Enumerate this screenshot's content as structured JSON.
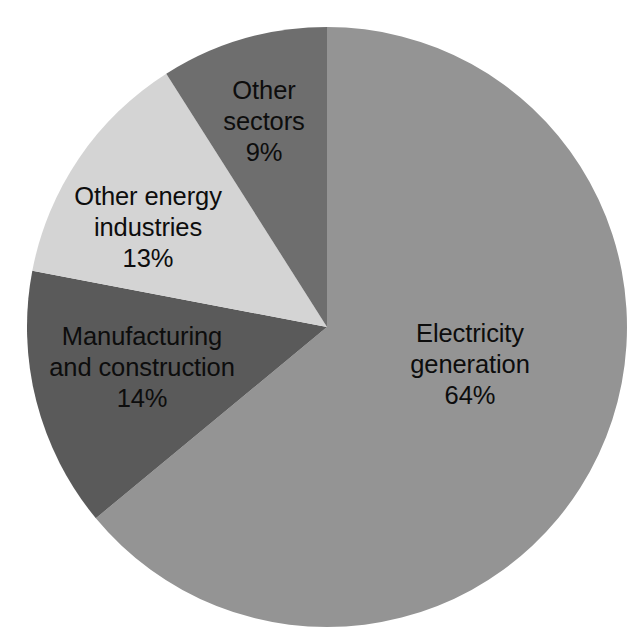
{
  "chart_data": {
    "type": "pie",
    "title": "",
    "subtitle": "",
    "xlabel": "",
    "ylabel": "",
    "legend_position": "none",
    "grid": false,
    "labels_inside": true,
    "units": "percent",
    "total": 100,
    "categories": [
      "Electricity generation",
      "Manufacturing and construction",
      "Other energy industries",
      "Other sectors"
    ],
    "values": [
      64,
      14,
      13,
      9
    ],
    "value_labels": [
      "64%",
      "14%",
      "13%",
      "9%"
    ],
    "colors": [
      "#949494",
      "#5a5a5a",
      "#d4d4d4",
      "#6e6e6e"
    ],
    "start_angle_deg": 0,
    "direction": "clockwise",
    "slices": [
      {
        "name": "Electricity generation",
        "label_lines": [
          "Electricity",
          "generation"
        ],
        "value": 64,
        "value_label": "64%",
        "color": "#949494",
        "start_deg": 0,
        "end_deg": 230.4,
        "label_x": 470,
        "label_y": 365
      },
      {
        "name": "Manufacturing and construction",
        "label_lines": [
          "Manufacturing",
          "and construction"
        ],
        "value": 14,
        "value_label": "14%",
        "color": "#5a5a5a",
        "start_deg": 230.4,
        "end_deg": 280.8,
        "label_x": 142,
        "label_y": 368
      },
      {
        "name": "Other energy industries",
        "label_lines": [
          "Other energy",
          "industries"
        ],
        "value": 13,
        "value_label": "13%",
        "color": "#d4d4d4",
        "start_deg": 280.8,
        "end_deg": 327.6,
        "label_x": 148,
        "label_y": 228
      },
      {
        "name": "Other sectors",
        "label_lines": [
          "Other",
          "sectors"
        ],
        "value": 9,
        "value_label": "9%",
        "color": "#6e6e6e",
        "start_deg": 327.6,
        "end_deg": 360,
        "label_x": 264,
        "label_y": 122
      }
    ],
    "geometry": {
      "center_x": 327,
      "center_y": 327,
      "radius": 300
    },
    "background_color": "#ffffff",
    "label_text_color": "#0d0d0d"
  }
}
